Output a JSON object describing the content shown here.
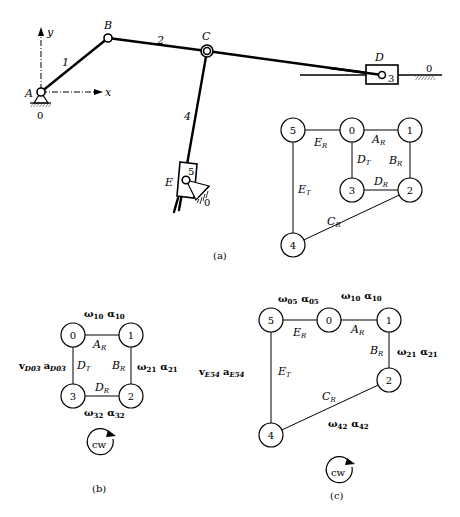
{
  "figure": {
    "panel_a": {
      "caption": "(a)",
      "points": {
        "A": "A",
        "B": "B",
        "C": "C",
        "D": "D",
        "E": "E"
      },
      "links": {
        "l1": "1",
        "l2": "2",
        "l3": "3",
        "l4": "4",
        "l5": "5",
        "ground_A": "0",
        "ground_D": "0",
        "ground_E": "0"
      },
      "axes": {
        "x": "x",
        "y": "y"
      },
      "graph": {
        "nodes": [
          "5",
          "0",
          "1",
          "3",
          "2",
          "4"
        ],
        "edges": {
          "AR": "A",
          "BR": "B",
          "DR": "D",
          "DT": "D",
          "ER": "E",
          "ET": "E",
          "CR": "C"
        },
        "edge_subs": {
          "R": "R",
          "T": "T"
        }
      }
    },
    "panel_b": {
      "caption": "(b)",
      "nodes": [
        "0",
        "1",
        "3",
        "2"
      ],
      "labels": {
        "top": {
          "w": "ω",
          "wsub": "10",
          "a": "α",
          "asub": "10"
        },
        "right": {
          "w": "ω",
          "wsub": "21",
          "a": "α",
          "asub": "21"
        },
        "bottom": {
          "w": "ω",
          "wsub": "32",
          "a": "α",
          "asub": "32"
        },
        "left": {
          "v": "v",
          "vsub": "D03",
          "a": "a",
          "asub": "D03"
        }
      },
      "edges": {
        "AR": "A",
        "BR": "B",
        "DR": "D",
        "DT": "D"
      },
      "loop_direction": "cw"
    },
    "panel_c": {
      "caption": "(c)",
      "nodes": [
        "5",
        "0",
        "1",
        "2",
        "4"
      ],
      "labels": {
        "top_left": {
          "w": "ω",
          "wsub": "05",
          "a": "α",
          "asub": "05"
        },
        "top_right": {
          "w": "ω",
          "wsub": "10",
          "a": "α",
          "asub": "10"
        },
        "right": {
          "w": "ω",
          "wsub": "21",
          "a": "α",
          "asub": "21"
        },
        "bottom": {
          "w": "ω",
          "wsub": "42",
          "a": "α",
          "asub": "42"
        },
        "left": {
          "v": "v",
          "vsub": "E54",
          "a": "a",
          "asub": "E54"
        }
      },
      "edges": {
        "ER": "E",
        "AR": "A",
        "BR": "B",
        "CR": "C",
        "ET": "E"
      },
      "loop_direction": "cw"
    }
  }
}
